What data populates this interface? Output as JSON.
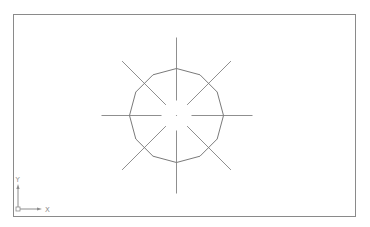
{
  "drawing": {
    "frame": {
      "x": 13.5,
      "y": 14.5,
      "width": 342,
      "height": 202,
      "stroke": "#8a8a8a"
    },
    "center": {
      "x": 176.5,
      "y": 115.5
    },
    "polygon": {
      "sides": 12,
      "radius": 47,
      "stroke": "#7a7a7a"
    },
    "centerline_gap": 15,
    "crosshair_lines": [
      {
        "name": "vertical",
        "angle": 90,
        "length_up": 78,
        "length_down": 78
      },
      {
        "name": "horizontal",
        "angle": 0,
        "length_left": 75,
        "length_right": 76
      },
      {
        "name": "diagonal-45",
        "angle": 45,
        "length": 77
      },
      {
        "name": "diagonal-135",
        "angle": 135,
        "length": 77
      }
    ],
    "line_color": "#8f8f8f"
  },
  "ucs_icon": {
    "origin": {
      "x": 18,
      "y": 209
    },
    "x_label": "X",
    "y_label": "Y",
    "color": "#8c8c8c"
  }
}
